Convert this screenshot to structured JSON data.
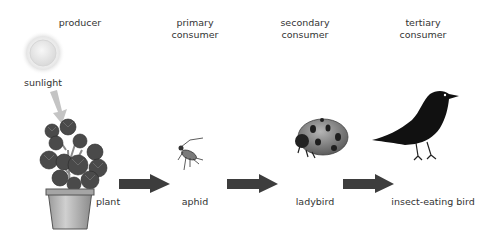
{
  "diagram": {
    "levels": [
      {
        "heading": "producer",
        "heading_line2": "",
        "organism": "plant"
      },
      {
        "heading": "primary",
        "heading_line2": "consumer",
        "organism": "aphid"
      },
      {
        "heading": "secondary",
        "heading_line2": "consumer",
        "organism": "ladybird"
      },
      {
        "heading": "tertiary",
        "heading_line2": "consumer",
        "organism": "insect-eating bird"
      }
    ],
    "energy_source": "sunlight",
    "arrow_color": "#3d3d3d",
    "sun_arrow_color": "#bdbdbd"
  }
}
